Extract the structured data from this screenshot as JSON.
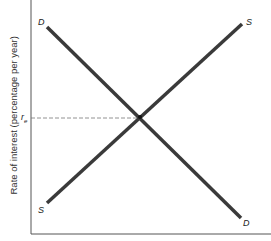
{
  "diagram": {
    "y_axis_label": "Rate of interest (percentage per year)",
    "equilibrium_label": "r",
    "equilibrium_subscript": "e",
    "curves": [
      {
        "name": "Demand",
        "start_label": "D",
        "end_label": "D"
      },
      {
        "name": "Supply",
        "start_label": "S",
        "end_label": "S"
      }
    ],
    "colors": {
      "curve": "#3a3a3a",
      "axis": "#555555",
      "dashed": "#777777"
    }
  }
}
